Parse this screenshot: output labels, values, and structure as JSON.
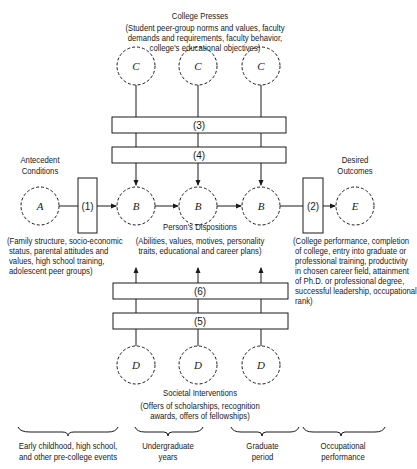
{
  "college_presses": {
    "title": "College Presses",
    "desc_lines": [
      "(Student peer-group norms and values, faculty",
      "demands and requirements, faculty behavior,",
      "college's educational objectives)"
    ],
    "node_label": "C"
  },
  "antecedent": {
    "title_lines": [
      "Antecedent",
      "Conditions"
    ],
    "node_label": "A",
    "desc_lines": [
      "(Family structure, socio-economic",
      "status, parental  attitudes and",
      "values, high school training,",
      "adolescent peer groups)"
    ]
  },
  "dispositions": {
    "title": "Person's Dispositions",
    "node_label": "B",
    "desc_lines": [
      "(Abilities, values, motives, personality",
      "traits, educational and career plans)"
    ]
  },
  "outcomes": {
    "title_lines": [
      "Desired",
      "Outcomes"
    ],
    "node_label": "E",
    "desc_lines": [
      "(College performance, completion",
      "of college, entry into graduate or",
      "professional training, productivity",
      "in chosen career field, attainment",
      "of Ph.D. or professional degree,",
      "successful leadership, occupational",
      "rank)"
    ]
  },
  "interventions": {
    "title": "Societal Interventions",
    "node_label": "D",
    "desc_lines": [
      "(Offers of scholarships, recognition",
      "awards, offers of fellowships)"
    ]
  },
  "boxes": {
    "b1": "(1)",
    "b2": "(2)",
    "b3": "(3)",
    "b4": "(4)",
    "b5": "(5)",
    "b6": "(6)"
  },
  "periods": [
    {
      "lines": [
        "Early childhood, high school,",
        "and other pre-college events"
      ]
    },
    {
      "lines": [
        "Undergraduate",
        "years"
      ]
    },
    {
      "lines": [
        "Graduate",
        "period"
      ]
    },
    {
      "lines": [
        "Occupational",
        "performance"
      ]
    }
  ],
  "colors": {
    "ink": "#1a1a1a",
    "background": "#ffffff"
  }
}
